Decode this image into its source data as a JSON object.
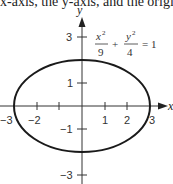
{
  "header_text": "x-axis, the y-axis, and the origin",
  "diagram": {
    "type": "ellipse-plot",
    "equation": {
      "x_term_num": "x",
      "x_term_exp": "2",
      "x_term_den": "9",
      "plus": "+",
      "y_term_num": "y",
      "y_term_exp": "2",
      "y_term_den": "4",
      "equals": "= 1"
    },
    "axes": {
      "x_label": "x",
      "y_label": "y",
      "x_ticks": [
        "−3",
        "−2",
        "1",
        "2",
        "3"
      ],
      "y_ticks": [
        "3",
        "1",
        "−1",
        "−3"
      ]
    },
    "ellipse": {
      "a": 3,
      "b": 2,
      "center": [
        0,
        0
      ]
    },
    "colors": {
      "curve": "#1a1a1a",
      "axis": "#333333"
    }
  }
}
